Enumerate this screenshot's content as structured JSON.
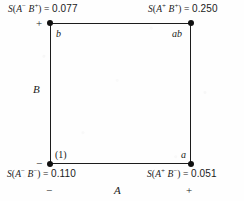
{
  "figure": {
    "kind": "two-level-factorial-square-plot",
    "line_color": "#1c1c1c",
    "point_color": "#101010",
    "background_color": "#fefefe"
  },
  "axes": {
    "horizontal": {
      "name": "A",
      "low_level": "−",
      "high_level": "+"
    },
    "vertical": {
      "name": "B",
      "low_level": "−",
      "high_level": "+"
    }
  },
  "corners": {
    "bottom_left": {
      "treatment": "(1)"
    },
    "bottom_right": {
      "treatment": "a"
    },
    "top_left": {
      "treatment": "b"
    },
    "top_right": {
      "treatment": "ab"
    }
  },
  "formulas": {
    "top_left": {
      "fn": "S",
      "open": "(",
      "factor_a": "A",
      "sign_a": "−",
      "factor_b": "B",
      "sign_b": "+",
      "close": ")",
      "equals": "=",
      "value": "0.077"
    },
    "top_right": {
      "fn": "S",
      "open": "(",
      "factor_a": "A",
      "sign_a": "+",
      "factor_b": "B",
      "sign_b": "+",
      "close": ")",
      "equals": "=",
      "value": "0.250"
    },
    "bottom_left": {
      "fn": "S",
      "open": "(",
      "factor_a": "A",
      "sign_a": "−",
      "factor_b": "B",
      "sign_b": "−",
      "close": ")",
      "equals": "=",
      "value": "0.110"
    },
    "bottom_right": {
      "fn": "S",
      "open": "(",
      "factor_a": "A",
      "sign_a": "+",
      "factor_b": "B",
      "sign_b": "−",
      "close": ")",
      "equals": "=",
      "value": "0.051"
    }
  },
  "chart_data": {
    "type": "scatter",
    "title": "",
    "xlabel": "A",
    "ylabel": "B",
    "xlim": [
      -1,
      1
    ],
    "ylim": [
      -1,
      1
    ],
    "xticklabels": [
      "−",
      "+"
    ],
    "yticklabels": [
      "−",
      "+"
    ],
    "grid": false,
    "legend": "none",
    "categories": [
      "(1)",
      "a",
      "b",
      "ab"
    ],
    "values": [
      0.11,
      0.051,
      0.077,
      0.25
    ],
    "points": [
      {
        "label": "(1)",
        "A": "−",
        "B": "−",
        "x": -1,
        "y": -1,
        "value": 0.11,
        "formula": "S(A−B−) = 0.110"
      },
      {
        "label": "a",
        "A": "+",
        "B": "−",
        "x": 1,
        "y": -1,
        "value": 0.051,
        "formula": "S(A+B−) = 0.051"
      },
      {
        "label": "b",
        "A": "−",
        "B": "+",
        "x": -1,
        "y": 1,
        "value": 0.077,
        "formula": "S(A−B+) = 0.077"
      },
      {
        "label": "ab",
        "A": "+",
        "B": "+",
        "x": 1,
        "y": 1,
        "value": 0.25,
        "formula": "S(A+B+) = 0.250"
      }
    ]
  }
}
